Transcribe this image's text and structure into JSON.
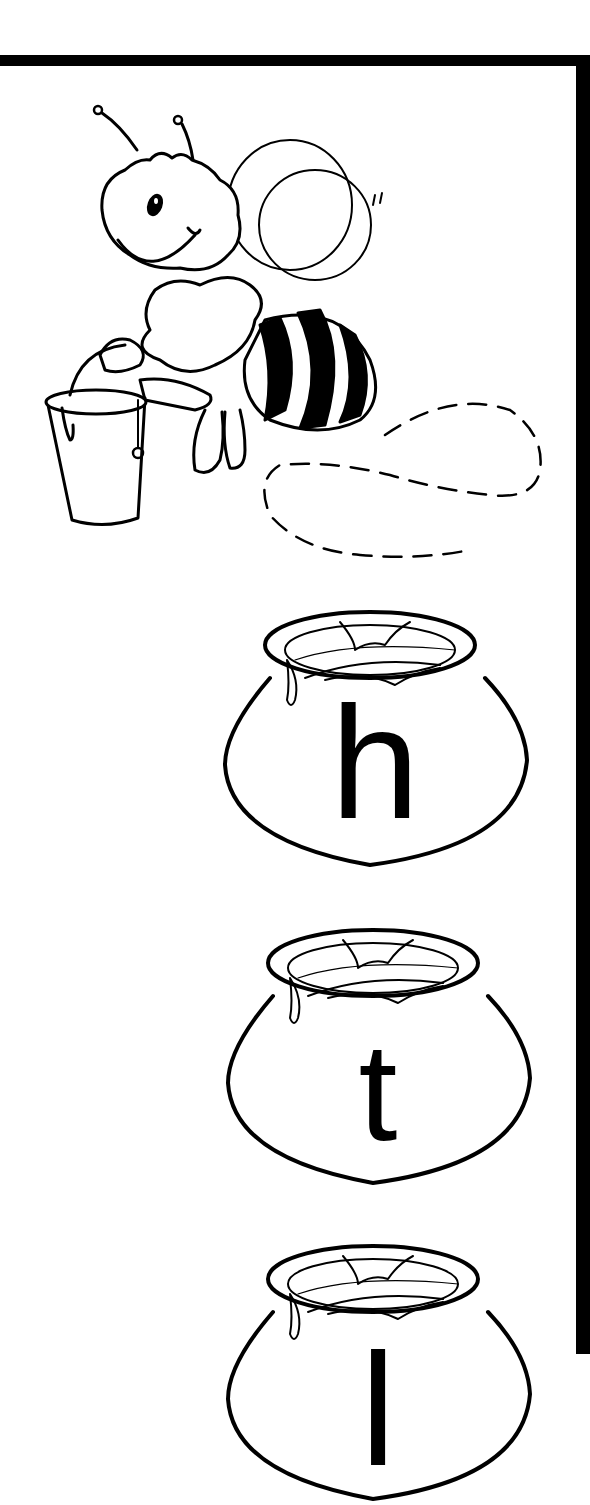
{
  "worksheet": {
    "frame_color": "#000000",
    "background_color": "#ffffff",
    "illustration": {
      "subject": "bee carrying honey bucket",
      "flight_path": "dashed loop trail"
    },
    "honey_pots": [
      {
        "letter": "h",
        "top": 600
      },
      {
        "letter": "t",
        "top": 918
      },
      {
        "letter": "l",
        "top": 1234
      }
    ]
  }
}
